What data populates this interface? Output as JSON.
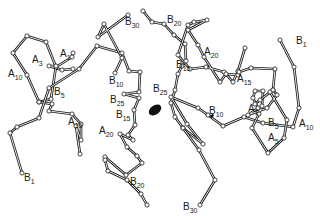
{
  "diagram": {
    "type": "protein-backbone-trace",
    "background": "#ffffff",
    "ink": "#1a1a1a",
    "chains": [
      {
        "name": "molecule-1-chain-A",
        "points": [
          [
            73,
            53
          ],
          [
            72,
            57
          ],
          [
            56,
            67
          ],
          [
            46,
            42
          ],
          [
            27,
            36
          ],
          [
            13,
            53
          ],
          [
            27,
            75
          ],
          [
            39,
            102
          ],
          [
            51,
            99
          ],
          [
            56,
            66
          ],
          [
            49,
            66
          ],
          [
            62,
            70
          ],
          [
            73,
            69
          ]
        ]
      },
      {
        "name": "molecule-1-chain-A-tail",
        "points": [
          [
            39,
            102
          ],
          [
            52,
            104
          ],
          [
            49,
            111
          ],
          [
            72,
            114
          ],
          [
            81,
            124
          ],
          [
            81,
            140
          ],
          [
            76,
            126
          ],
          [
            80,
            154
          ]
        ]
      },
      {
        "name": "molecule-1-chain-B",
        "points": [
          [
            22,
            173
          ],
          [
            10,
            133
          ],
          [
            17,
            127
          ],
          [
            39,
            118
          ],
          [
            49,
            88
          ],
          [
            79,
            69
          ],
          [
            97,
            46
          ],
          [
            122,
            53
          ],
          [
            129,
            71
          ],
          [
            140,
            72
          ],
          [
            139,
            92
          ],
          [
            124,
            94
          ],
          [
            139,
            98
          ],
          [
            134,
            110
          ],
          [
            135,
            125
          ],
          [
            128,
            135
          ],
          [
            133,
            140
          ],
          [
            120,
            134
          ],
          [
            127,
            147
          ],
          [
            137,
            156
          ],
          [
            142,
            163
          ],
          [
            126,
            175
          ],
          [
            105,
            157
          ],
          [
            105,
            160
          ],
          [
            108,
            171
          ],
          [
            127,
            180
          ],
          [
            141,
            194
          ],
          [
            147,
            205
          ]
        ]
      },
      {
        "name": "molecule-1-chain-B-upper",
        "points": [
          [
            115,
            73
          ],
          [
            122,
            58
          ],
          [
            104,
            24
          ],
          [
            98,
            37
          ],
          [
            128,
            15
          ]
        ]
      },
      {
        "name": "molecule-2-chain-B",
        "points": [
          [
            143,
            11
          ],
          [
            152,
            22
          ],
          [
            164,
            24
          ],
          [
            174,
            35
          ],
          [
            185,
            44
          ],
          [
            186,
            61
          ],
          [
            182,
            66
          ],
          [
            178,
            74
          ],
          [
            175,
            90
          ],
          [
            171,
            103
          ],
          [
            175,
            117
          ],
          [
            183,
            128
          ],
          [
            203,
            144
          ],
          [
            187,
            124
          ],
          [
            171,
            97
          ],
          [
            198,
            108
          ],
          [
            208,
            115
          ],
          [
            223,
            126
          ],
          [
            244,
            117
          ],
          [
            263,
            123
          ],
          [
            293,
            127
          ],
          [
            299,
            108
          ],
          [
            294,
            67
          ],
          [
            280,
            40
          ]
        ]
      },
      {
        "name": "molecule-2-chain-B-lower",
        "points": [
          [
            183,
            128
          ],
          [
            199,
            150
          ],
          [
            215,
            180
          ],
          [
            200,
            205
          ]
        ]
      },
      {
        "name": "molecule-2-chain-A",
        "points": [
          [
            245,
            48
          ],
          [
            238,
            71
          ],
          [
            233,
            82
          ],
          [
            224,
            72
          ],
          [
            206,
            67
          ],
          [
            190,
            69
          ],
          [
            178,
            55
          ],
          [
            188,
            25
          ],
          [
            194,
            22
          ],
          [
            207,
            20
          ],
          [
            188,
            30
          ],
          [
            198,
            45
          ],
          [
            204,
            57
          ],
          [
            220,
            82
          ],
          [
            226,
            74
          ],
          [
            238,
            75
          ],
          [
            239,
            72
          ],
          [
            251,
            68
          ],
          [
            275,
            69
          ],
          [
            273,
            90
          ],
          [
            277,
            95
          ],
          [
            267,
            108
          ],
          [
            248,
            115
          ],
          [
            258,
            108
          ],
          [
            253,
            98
          ],
          [
            255,
            91
          ],
          [
            263,
            91
          ],
          [
            262,
            106
          ],
          [
            259,
            114
          ],
          [
            252,
            128
          ],
          [
            268,
            153
          ],
          [
            284,
            138
          ],
          [
            287,
            120
          ],
          [
            270,
            92
          ]
        ]
      },
      {
        "name": "molecule-2-chain-A-tail",
        "points": [
          [
            273,
            90
          ],
          [
            260,
            100
          ],
          [
            255,
            104
          ]
        ]
      }
    ],
    "ions": [
      {
        "name": "zinc-ion-center",
        "cx": 155,
        "cy": 110,
        "rx": 7,
        "ry": 4.5,
        "rotate": -35
      },
      {
        "name": "zinc-ion-small",
        "cx": 212,
        "cy": 116,
        "rx": 2.2,
        "ry": 1.3,
        "rotate": -45
      }
    ],
    "labels": [
      {
        "id": "B30_top",
        "main": "B",
        "sub": "30",
        "x": 125,
        "y": 25
      },
      {
        "id": "B20_top",
        "main": "B",
        "sub": "20",
        "x": 167,
        "y": 23
      },
      {
        "id": "A1_left",
        "main": "A",
        "sub": "1",
        "x": 60,
        "y": 57
      },
      {
        "id": "A3",
        "main": "A",
        "sub": "3",
        "x": 32,
        "y": 63
      },
      {
        "id": "A10_left",
        "main": "A",
        "sub": "10",
        "x": 8,
        "y": 77
      },
      {
        "id": "B5_left",
        "main": "B",
        "sub": "5",
        "x": 54,
        "y": 95
      },
      {
        "id": "B10_left",
        "main": "B",
        "sub": "10",
        "x": 109,
        "y": 84
      },
      {
        "id": "B25_left",
        "main": "B",
        "sub": "25",
        "x": 110,
        "y": 103
      },
      {
        "id": "B15_left",
        "main": "B",
        "sub": "15",
        "x": 116,
        "y": 118
      },
      {
        "id": "A20_left",
        "main": "A",
        "sub": "20",
        "x": 99,
        "y": 134
      },
      {
        "id": "A15_left",
        "main": "A",
        "sub": "15",
        "x": 68,
        "y": 125
      },
      {
        "id": "B1_left",
        "main": "B",
        "sub": "1",
        "x": 24,
        "y": 181
      },
      {
        "id": "B20_bottom",
        "main": "B",
        "sub": "20",
        "x": 130,
        "y": 185
      },
      {
        "id": "B30_bottom",
        "main": "B",
        "sub": "30",
        "x": 183,
        "y": 210
      },
      {
        "id": "B25_right",
        "main": "B",
        "sub": "25",
        "x": 153,
        "y": 92
      },
      {
        "id": "B15_right",
        "main": "B",
        "sub": "15",
        "x": 176,
        "y": 68
      },
      {
        "id": "A20_right",
        "main": "A",
        "sub": "20",
        "x": 204,
        "y": 55
      },
      {
        "id": "A15_right",
        "main": "A",
        "sub": "15",
        "x": 237,
        "y": 82
      },
      {
        "id": "B1_right",
        "main": "B",
        "sub": "1",
        "x": 296,
        "y": 44
      },
      {
        "id": "B10_right",
        "main": "B",
        "sub": "10",
        "x": 209,
        "y": 114
      },
      {
        "id": "A1_right",
        "main": "A",
        "sub": "1",
        "x": 248,
        "y": 112
      },
      {
        "id": "B5_right",
        "main": "B",
        "sub": "5",
        "x": 268,
        "y": 126
      },
      {
        "id": "A5_right",
        "main": "A",
        "sub": "5",
        "x": 268,
        "y": 141
      },
      {
        "id": "A10_right",
        "main": "A",
        "sub": "10",
        "x": 299,
        "y": 127
      }
    ]
  }
}
